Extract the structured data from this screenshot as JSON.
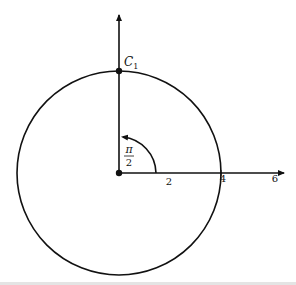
{
  "diagram": {
    "type": "polar-circle",
    "point_label": "C",
    "point_subscript": "1",
    "angle_label_numerator": "π",
    "angle_label_denominator": "2",
    "x_axis_ticks": [
      "2",
      "4",
      "6"
    ],
    "circle": {
      "center": [
        0,
        0
      ],
      "radius": 4
    },
    "point": {
      "r": 4,
      "theta": "π/2"
    },
    "colors": {
      "stroke": "#111111",
      "background": "#ffffff"
    }
  }
}
